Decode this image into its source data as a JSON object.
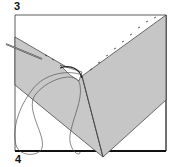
{
  "labels": {
    "step_top": "3",
    "step_bottom": "4"
  },
  "colors": {
    "fabric_shade": "#c8c8c8",
    "outline": "#222222",
    "background": "#ffffff"
  }
}
